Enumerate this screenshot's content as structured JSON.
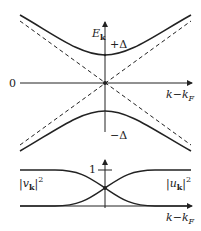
{
  "diagram": {
    "upper_panel": {
      "y_axis_label": "E",
      "y_axis_label_sub": "k",
      "x_axis_label": "k",
      "x_axis_label_minus": "−",
      "x_axis_label_k2": "k",
      "x_axis_label_sub": "F",
      "origin_label": "0",
      "gap_plus_label": "+Δ",
      "gap_minus_label": "−Δ",
      "curves": [
        "upper branch +sqrt(ξ²+Δ²)",
        "lower branch −sqrt(ξ²+Δ²)",
        "dashed asymptote +ξ",
        "dashed asymptote −ξ"
      ]
    },
    "lower_panel": {
      "tick_label": "1",
      "left_label": "|v",
      "left_label_sub": "k",
      "left_label_close": "|",
      "left_label_sup": "2",
      "right_label": "|u",
      "right_label_sub": "k",
      "right_label_close": "|",
      "right_label_sup": "2",
      "x_axis_label": "k",
      "x_axis_label_minus": "−",
      "x_axis_label_k2": "k",
      "x_axis_label_sub": "F"
    },
    "colors": {
      "line": "#222222",
      "background": "#ffffff"
    }
  }
}
